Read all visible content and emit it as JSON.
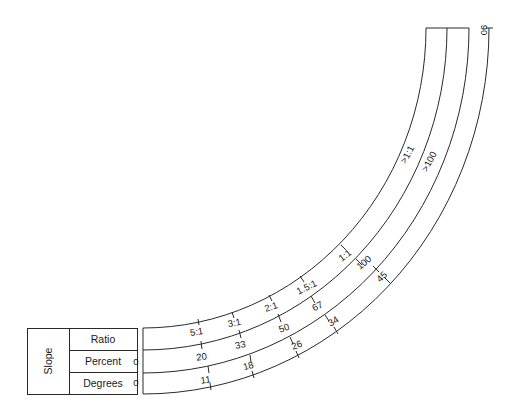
{
  "table": {
    "group_label": "Slope",
    "rows": [
      {
        "label": "Ratio"
      },
      {
        "label": "Percent",
        "start_value": "0"
      },
      {
        "label": "Degrees",
        "start_value": "0"
      }
    ]
  },
  "scale": {
    "ratio_ticks": [
      "5:1",
      "3:1",
      "2:1",
      "1.5:1",
      "1:1",
      ">1:1"
    ],
    "percent_ticks": [
      "20",
      "33",
      "50",
      "67",
      "100",
      ">100"
    ],
    "degree_ticks": [
      "11",
      "18",
      "26",
      "34",
      "45",
      "90"
    ]
  },
  "colors": {
    "line": "#2a2a2a",
    "text": "#1a1a1a",
    "background": "#ffffff"
  }
}
